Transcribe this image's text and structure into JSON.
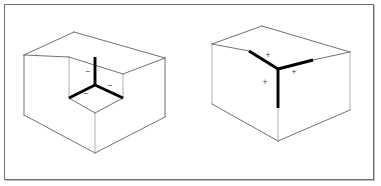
{
  "figure": {
    "frame": {
      "border_color": "#6d7074",
      "background_color": "#ffffff",
      "shadow_color": "#b9bbbd"
    },
    "colors": {
      "thin_edge": "#4a4d51",
      "thin_edge_faint": "#9a9da1",
      "thick_edge": "#000000",
      "label_text": "#3a3d41"
    },
    "panels": [
      {
        "id": "left-panel",
        "name": "concave-corner-figure",
        "description": "Cube with a corner block removed, showing an interior concave trihedral vertex",
        "vertex_type": "concave",
        "junction_kind": "Y-junction",
        "labels": [
          {
            "id": "left-label-up",
            "text": "−",
            "x": 88,
            "y": 72
          },
          {
            "id": "left-label-lower-left",
            "text": "−",
            "x": 86,
            "y": 94
          },
          {
            "id": "left-label-right",
            "text": "−",
            "x": 110,
            "y": 86
          }
        ],
        "thick_lines": [
          {
            "id": "left-thick-up",
            "x1": 95,
            "y1": 85,
            "x2": 95,
            "y2": 57
          },
          {
            "id": "left-thick-lower-left",
            "x1": 95,
            "y1": 85,
            "x2": 69,
            "y2": 98
          },
          {
            "id": "left-thick-lower-right",
            "x1": 95,
            "y1": 85,
            "x2": 123,
            "y2": 98
          }
        ],
        "thin_edges": [
          {
            "id": "left-top-back-left",
            "points": "24,55 74,32"
          },
          {
            "id": "left-top-back-right",
            "points": "74,32 165,58"
          },
          {
            "id": "left-top-front-right",
            "points": "165,58 123,74"
          },
          {
            "id": "left-notch-top-left",
            "points": "123,74 69,57"
          },
          {
            "id": "left-notch-left",
            "points": "69,57 24,55"
          },
          {
            "id": "left-inner-v-left",
            "points": "69,57 69,98"
          },
          {
            "id": "left-inner-v-center",
            "points": "95,57 95,85"
          },
          {
            "id": "left-inner-v-right",
            "points": "123,74 123,98"
          },
          {
            "id": "left-floor-left",
            "points": "69,98 95,113"
          },
          {
            "id": "left-floor-right",
            "points": "95,113 123,98"
          },
          {
            "id": "left-outer-left",
            "points": "24,55 24,115"
          },
          {
            "id": "left-outer-left-base",
            "points": "24,115 95,153"
          },
          {
            "id": "left-outer-right-base",
            "points": "95,153 165,117"
          },
          {
            "id": "left-outer-right",
            "points": "165,58 165,117"
          },
          {
            "id": "left-front-v",
            "points": "95,113 95,153"
          }
        ]
      },
      {
        "id": "right-panel",
        "name": "convex-corner-figure",
        "description": "Solid cube seen from above, showing an exterior convex trihedral vertex",
        "vertex_type": "convex",
        "junction_kind": "Y-junction",
        "labels": [
          {
            "id": "right-label-upper-left",
            "text": "+",
            "x": 268,
            "y": 56
          },
          {
            "id": "right-label-lower-left",
            "text": "+",
            "x": 265,
            "y": 83
          },
          {
            "id": "right-label-right",
            "text": "+",
            "x": 294,
            "y": 73
          }
        ],
        "thick_lines": [
          {
            "id": "right-thick-upper-left",
            "x1": 278,
            "y1": 69,
            "x2": 249,
            "y2": 51
          },
          {
            "id": "right-thick-upper-right",
            "x1": 278,
            "y1": 69,
            "x2": 313,
            "y2": 60
          },
          {
            "id": "right-thick-down",
            "x1": 278,
            "y1": 69,
            "x2": 278,
            "y2": 108
          }
        ],
        "thin_edges": [
          {
            "id": "right-top-back-left",
            "points": "212,44 262,26"
          },
          {
            "id": "right-top-back-right",
            "points": "262,26 350,52"
          },
          {
            "id": "right-top-front-right",
            "points": "350,52 313,60"
          },
          {
            "id": "right-top-front-left",
            "points": "249,51 212,44"
          },
          {
            "id": "right-left-vertical",
            "points": "212,44 212,104"
          },
          {
            "id": "right-right-vertical",
            "points": "350,52 350,110"
          },
          {
            "id": "right-base-left",
            "points": "212,104 278,141"
          },
          {
            "id": "right-base-right",
            "points": "278,141 350,110"
          },
          {
            "id": "right-front-vertical",
            "points": "278,108 278,141"
          }
        ]
      }
    ]
  }
}
